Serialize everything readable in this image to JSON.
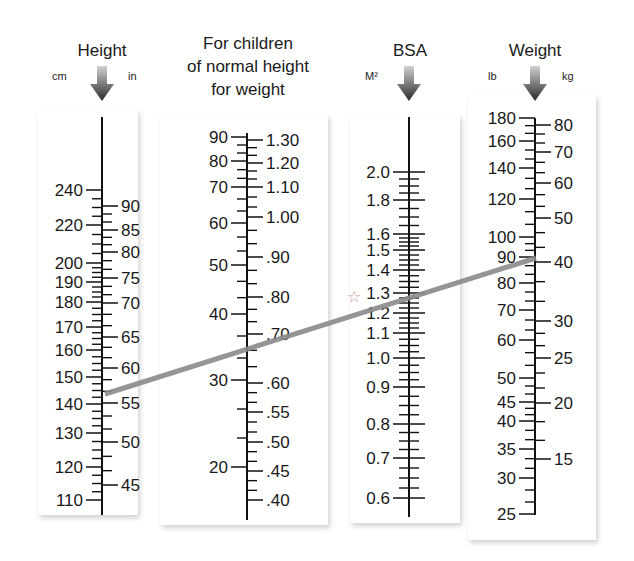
{
  "chart_data": {
    "type": "nomogram",
    "scales": [
      {
        "id": "height",
        "title": "Height",
        "units_left": "cm",
        "units_right": "in",
        "axis_x": 102,
        "y_top": 117,
        "y_bottom": 515,
        "left_labels": [
          {
            "v": "240",
            "y": 190
          },
          {
            "v": "220",
            "y": 225
          },
          {
            "v": "200",
            "y": 263
          },
          {
            "v": "190",
            "y": 282
          },
          {
            "v": "180",
            "y": 302
          },
          {
            "v": "170",
            "y": 327
          },
          {
            "v": "160",
            "y": 350
          },
          {
            "v": "150",
            "y": 377
          },
          {
            "v": "140",
            "y": 404
          },
          {
            "v": "130",
            "y": 433
          },
          {
            "v": "120",
            "y": 467
          },
          {
            "v": "110",
            "y": 500
          }
        ],
        "right_labels": [
          {
            "v": "90",
            "y": 206
          },
          {
            "v": "85",
            "y": 230
          },
          {
            "v": "80",
            "y": 252
          },
          {
            "v": "75",
            "y": 278
          },
          {
            "v": "70",
            "y": 303
          },
          {
            "v": "65",
            "y": 337
          },
          {
            "v": "60",
            "y": 368
          },
          {
            "v": "55",
            "y": 403
          },
          {
            "v": "50",
            "y": 442
          },
          {
            "v": "45",
            "y": 485
          }
        ]
      },
      {
        "id": "children",
        "title_lines": [
          "For children",
          "of normal height",
          "for weight"
        ],
        "axis_x": 247,
        "y_top": 133,
        "y_bottom": 520,
        "left_labels": [
          {
            "v": "90",
            "y": 137
          },
          {
            "v": "80",
            "y": 161
          },
          {
            "v": "70",
            "y": 187
          },
          {
            "v": "60",
            "y": 223
          },
          {
            "v": "50",
            "y": 265
          },
          {
            "v": "40",
            "y": 314
          },
          {
            "v": "30",
            "y": 380
          },
          {
            "v": "20",
            "y": 467
          }
        ],
        "right_labels": [
          {
            "v": "1.30",
            "y": 140
          },
          {
            "v": "1.20",
            "y": 163
          },
          {
            "v": "1.10",
            "y": 187
          },
          {
            "v": "1.00",
            "y": 217
          },
          {
            "v": ".90",
            "y": 257
          },
          {
            "v": ".80",
            "y": 297
          },
          {
            "v": ".70",
            "y": 334
          },
          {
            "v": ".60",
            "y": 383
          },
          {
            "v": ".55",
            "y": 412
          },
          {
            "v": ".50",
            "y": 442
          },
          {
            "v": ".45",
            "y": 471
          },
          {
            "v": ".40",
            "y": 500
          }
        ]
      },
      {
        "id": "bsa",
        "title": "BSA",
        "units_left": "M²",
        "axis_x": 409,
        "y_top": 117,
        "y_bottom": 517,
        "left_labels": [
          {
            "v": "2.0",
            "y": 172
          },
          {
            "v": "1.8",
            "y": 200
          },
          {
            "v": "1.6",
            "y": 234
          },
          {
            "v": "1.5",
            "y": 250
          },
          {
            "v": "1.4",
            "y": 270
          },
          {
            "v": "1.3",
            "y": 293
          },
          {
            "v": "1.2",
            "y": 313
          },
          {
            "v": "1.1",
            "y": 333
          },
          {
            "v": "1.0",
            "y": 358
          },
          {
            "v": "0.9",
            "y": 387
          },
          {
            "v": "0.8",
            "y": 424
          },
          {
            "v": "0.7",
            "y": 458
          },
          {
            "v": "0.6",
            "y": 498
          }
        ],
        "marker": {
          "symbol": "☆",
          "at": "1.3",
          "y": 296
        }
      },
      {
        "id": "weight",
        "title": "Weight",
        "units_left": "lb",
        "units_right": "kg",
        "axis_x": 535,
        "y_top": 118,
        "y_bottom": 515,
        "left_labels": [
          {
            "v": "180",
            "y": 118
          },
          {
            "v": "160",
            "y": 141
          },
          {
            "v": "140",
            "y": 168
          },
          {
            "v": "120",
            "y": 199
          },
          {
            "v": "100",
            "y": 237
          },
          {
            "v": "90",
            "y": 257
          },
          {
            "v": "80",
            "y": 283
          },
          {
            "v": "70",
            "y": 310
          },
          {
            "v": "60",
            "y": 340
          },
          {
            "v": "50",
            "y": 378
          },
          {
            "v": "45",
            "y": 402
          },
          {
            "v": "40",
            "y": 421
          },
          {
            "v": "35",
            "y": 449
          },
          {
            "v": "30",
            "y": 478
          },
          {
            "v": "25",
            "y": 514
          }
        ],
        "right_labels": [
          {
            "v": "80",
            "y": 125
          },
          {
            "v": "70",
            "y": 152
          },
          {
            "v": "60",
            "y": 183
          },
          {
            "v": "50",
            "y": 218
          },
          {
            "v": "40",
            "y": 262
          },
          {
            "v": "30",
            "y": 321
          },
          {
            "v": "25",
            "y": 358
          },
          {
            "v": "20",
            "y": 403
          },
          {
            "v": "15",
            "y": 459
          }
        ]
      }
    ],
    "example_line": {
      "from": {
        "scale": "height",
        "cm": 145,
        "in": 57,
        "x": 105,
        "y": 394
      },
      "to": {
        "scale": "weight",
        "lb": 90,
        "kg": 41,
        "x": 536,
        "y": 258
      },
      "intersects": {
        "children": 0.68,
        "bsa": 1.27
      },
      "color": "#8a8a8a"
    }
  }
}
